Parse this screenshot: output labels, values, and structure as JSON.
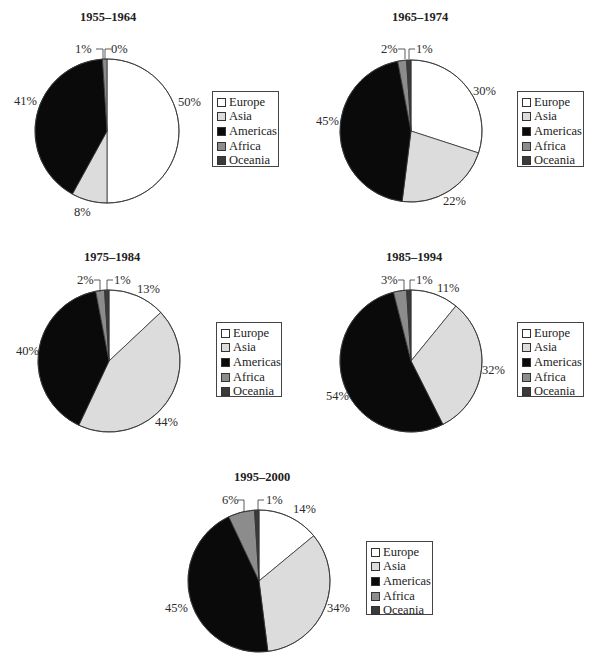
{
  "legend": {
    "categories": [
      "Europe",
      "Asia",
      "Americas",
      "Africa",
      "Oceania"
    ],
    "colors": [
      "#ffffff",
      "#dcdcdc",
      "#0a0a0a",
      "#8c8c8c",
      "#3a3a3a"
    ]
  },
  "charts": [
    {
      "title": "1955–1964",
      "labels": [
        "50%",
        "8%",
        "41%",
        "1%",
        "0%"
      ]
    },
    {
      "title": "1965–1974",
      "labels": [
        "30%",
        "22%",
        "45%",
        "2%",
        "1%"
      ]
    },
    {
      "title": "1975–1984",
      "labels": [
        "13%",
        "44%",
        "40%",
        "2%",
        "1%"
      ]
    },
    {
      "title": "1985–1994",
      "labels": [
        "11%",
        "32%",
        "54%",
        "3%",
        "1%"
      ]
    },
    {
      "title": "1995–2000",
      "labels": [
        "14%",
        "34%",
        "45%",
        "6%",
        "1%"
      ]
    }
  ],
  "chart_data": [
    {
      "type": "pie",
      "title": "1955–1964",
      "categories": [
        "Europe",
        "Asia",
        "Americas",
        "Africa",
        "Oceania"
      ],
      "values": [
        50,
        8,
        41,
        1,
        0
      ],
      "legend_position": "right"
    },
    {
      "type": "pie",
      "title": "1965–1974",
      "categories": [
        "Europe",
        "Asia",
        "Americas",
        "Africa",
        "Oceania"
      ],
      "values": [
        30,
        22,
        45,
        2,
        1
      ],
      "legend_position": "right"
    },
    {
      "type": "pie",
      "title": "1975–1984",
      "categories": [
        "Europe",
        "Asia",
        "Americas",
        "Africa",
        "Oceania"
      ],
      "values": [
        13,
        44,
        40,
        2,
        1
      ],
      "legend_position": "right"
    },
    {
      "type": "pie",
      "title": "1985–1994",
      "categories": [
        "Europe",
        "Asia",
        "Americas",
        "Africa",
        "Oceania"
      ],
      "values": [
        11,
        32,
        54,
        3,
        1
      ],
      "legend_position": "right"
    },
    {
      "type": "pie",
      "title": "1995–2000",
      "categories": [
        "Europe",
        "Asia",
        "Americas",
        "Africa",
        "Oceania"
      ],
      "values": [
        14,
        34,
        45,
        6,
        1
      ],
      "legend_position": "right"
    }
  ]
}
